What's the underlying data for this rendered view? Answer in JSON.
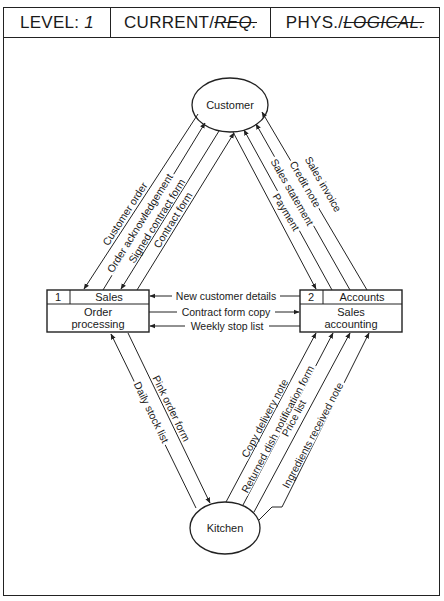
{
  "header": {
    "level_label": "LEVEL:",
    "level_value": "1",
    "current_label": "CURRENT/",
    "current_struck": "REQ.",
    "phys_label": "PHYS./",
    "phys_struck": "LOGICAL."
  },
  "entities": {
    "customer": "Customer",
    "kitchen": "Kitchen"
  },
  "processes": [
    {
      "id": "1",
      "location": "Sales",
      "line1": "Order",
      "line2": "processing"
    },
    {
      "id": "2",
      "location": "Accounts",
      "line1": "Sales",
      "line2": "accounting"
    }
  ],
  "flows": {
    "customer_sales": [
      "Customer order",
      "Order acknowledgement",
      "Signed contract form",
      "Contract form"
    ],
    "customer_accounts": [
      "Payment",
      "Sales statement",
      "Credit note",
      "Sales invoice"
    ],
    "between_processes": [
      "New customer details",
      "Contract form copy",
      "Weekly stop list"
    ],
    "sales_kitchen": [
      "Pink order form",
      "Daily stock list"
    ],
    "kitchen_accounts": [
      "Copy delivery note",
      "Returned dish notification form",
      "Price list",
      "Ingredients received note"
    ]
  },
  "colors": {
    "ink": "#222222",
    "paper": "#ffffff"
  }
}
